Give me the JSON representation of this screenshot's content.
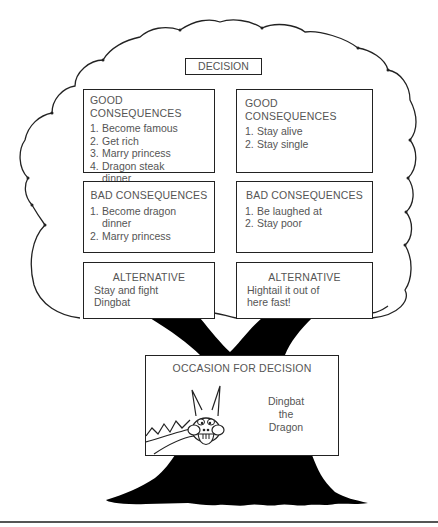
{
  "title": "DECISION",
  "colors": {
    "outline": "#222222",
    "trunk": "#000000",
    "text": "#555555",
    "background": "#ffffff"
  },
  "good_consequences": {
    "left": {
      "title": "GOOD CONSEQUENCES",
      "items": [
        {
          "num": "1.",
          "text": "Become famous"
        },
        {
          "num": "2.",
          "text": "Get rich"
        },
        {
          "num": "3.",
          "text": "Marry princess"
        },
        {
          "num": "4.",
          "text": "Dragon steak dinner"
        }
      ]
    },
    "right": {
      "title": "GOOD CONSEQUENCES",
      "items": [
        {
          "num": "1.",
          "text": "Stay alive"
        },
        {
          "num": "2.",
          "text": "Stay single"
        }
      ]
    }
  },
  "bad_consequences": {
    "left": {
      "title": "BAD CONSEQUENCES",
      "items": [
        {
          "num": "1.",
          "text": "Become dragon dinner"
        },
        {
          "num": "2.",
          "text": "Marry princess"
        }
      ]
    },
    "right": {
      "title": "BAD CONSEQUENCES",
      "items": [
        {
          "num": "1.",
          "text": "Be laughed at"
        },
        {
          "num": "2.",
          "text": "Stay poor"
        }
      ]
    }
  },
  "alternatives": {
    "left": {
      "title": "ALTERNATIVE",
      "text": "Stay and fight Dingbat"
    },
    "right": {
      "title": "ALTERNATIVE",
      "text": "Hightail it out of here fast!"
    }
  },
  "occasion": {
    "title": "OCCASION FOR DECISION",
    "name_lines": [
      "Dingbat",
      "the",
      "Dragon"
    ],
    "icon": "dragon-illustration"
  }
}
